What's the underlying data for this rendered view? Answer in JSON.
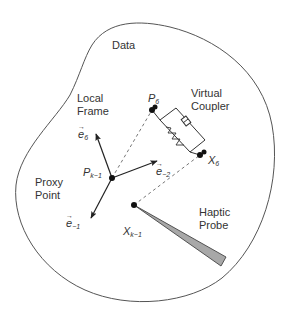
{
  "diagram": {
    "type": "haptic-rendering-proxy-diagram",
    "colors": {
      "outline": "#555555",
      "text": "#333333",
      "probe_fill": "#a8a8a8",
      "dot": "#111111"
    },
    "region_label": "Data",
    "labels": {
      "local_frame_line1": "Local",
      "local_frame_line2": "Frame",
      "virtual_coupler_line1": "Virtual",
      "virtual_coupler_line2": "Coupler",
      "proxy_point_line1": "Proxy",
      "proxy_point_line2": "Point",
      "haptic_probe_line1": "Haptic",
      "haptic_probe_line2": "Probe"
    },
    "points": {
      "p6": {
        "base": "P",
        "sub": "6"
      },
      "pk1": {
        "base": "P",
        "sub": "k−1"
      },
      "x6": {
        "base": "X",
        "sub": "6"
      },
      "xk1": {
        "base": "X",
        "sub": "k−1"
      }
    },
    "vectors": {
      "e6": {
        "base": "e",
        "sub": "6"
      },
      "em2": {
        "base": "e",
        "sub": "−2"
      },
      "em1": {
        "base": "e",
        "sub": "−1"
      }
    }
  }
}
